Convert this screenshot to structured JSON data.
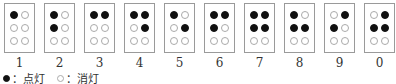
{
  "cells": [
    {
      "label": "1",
      "dots": [
        1,
        0,
        0,
        0,
        0,
        0
      ]
    },
    {
      "label": "2",
      "dots": [
        1,
        0,
        1,
        0,
        0,
        0
      ]
    },
    {
      "label": "3",
      "dots": [
        1,
        1,
        0,
        0,
        0,
        0
      ]
    },
    {
      "label": "4",
      "dots": [
        1,
        1,
        0,
        1,
        0,
        0
      ]
    },
    {
      "label": "5",
      "dots": [
        1,
        0,
        0,
        1,
        0,
        0
      ]
    },
    {
      "label": "6",
      "dots": [
        1,
        1,
        1,
        0,
        0,
        0
      ]
    },
    {
      "label": "7",
      "dots": [
        1,
        1,
        1,
        1,
        0,
        0
      ]
    },
    {
      "label": "8",
      "dots": [
        1,
        0,
        1,
        1,
        0,
        0
      ]
    },
    {
      "label": "9",
      "dots": [
        0,
        1,
        1,
        0,
        0,
        0
      ]
    },
    {
      "label": "0",
      "dots": [
        0,
        1,
        1,
        1,
        0,
        0
      ]
    }
  ],
  "legend": {
    "on_label": "：点灯",
    "off_label": "：消灯"
  }
}
